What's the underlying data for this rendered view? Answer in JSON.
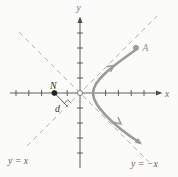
{
  "figure": {
    "type": "hyperbola-branch-with-asymptotes",
    "labels": {
      "x_axis": "x",
      "y_axis": "y",
      "asymptote_pos": "y = x",
      "asymptote_neg": "y = −x",
      "point_N": "N",
      "point_A": "A",
      "distance": "d"
    },
    "points": {
      "N": {
        "x": -2,
        "y": 0,
        "style": "filled-black-dot"
      },
      "origin": {
        "x": 0,
        "y": 0,
        "style": "open-circle"
      },
      "curve_vertex": {
        "x": 1,
        "y": 0
      },
      "A": {
        "style": "filled-gray-dot",
        "location": "on upper branch near asymptote y = x"
      }
    },
    "axes": {
      "x_ticks_left_of_origin": 5,
      "x_ticks_right_of_origin": 5,
      "y_ticks_above_origin": 4,
      "y_ticks_below_origin": 4
    },
    "curve": {
      "description": "right-opening hyperbola branch, vertex at (1,0), hugging asymptotes y = x and y = -x, with direction arrowheads and endpoint dot A",
      "asymptotes": [
        "y = x",
        "y = −x"
      ]
    },
    "annotation": {
      "perpendicular": "segment of length d from point N meeting line y = x at a right angle"
    },
    "colors": {
      "background": "#fbfbf9",
      "axis": "#4d4d4d",
      "asymptote": "#b1b1af",
      "curve": "#9a9a98",
      "dark_label": "#2b2b2b",
      "equation_label": "#5f5f5d",
      "axis_label": "#6e6e6c",
      "curve_label": "#8f8f8d"
    }
  }
}
